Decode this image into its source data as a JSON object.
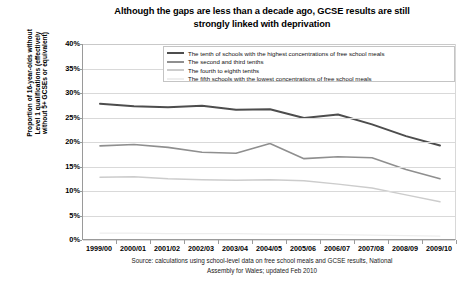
{
  "title": {
    "line1": "Although the gaps are less than a decade ago, GCSE results are still",
    "line2": "strongly linked with deprivation"
  },
  "yaxis_title": {
    "line1": "Proportion of 16-year-olds without",
    "line2": "Level 1 qualifications (effectively",
    "line3": "without 5+ GCSEs or equivalent)"
  },
  "source": {
    "line1": "Source: calculations using school-level data on free school meals and GCSE results, National",
    "line2": "Assembly for Wales; updated Feb 2010"
  },
  "colors": {
    "series1": "#4d4d4d",
    "series2": "#8f8f8f",
    "series3": "#cccccc",
    "series4": "#ededed",
    "grid": "#d9d9d9",
    "axis": "#9a9a9a",
    "background": "#ffffff"
  },
  "chart_data": {
    "type": "line",
    "title": "Although the gaps are less than a decade ago, GCSE results are still strongly linked with deprivation",
    "xlabel": "",
    "ylabel": "Proportion of 16-year-olds without Level 1 qualifications (effectively without 5+ GCSEs or equivalent)",
    "ylim": [
      0,
      40
    ],
    "yticks": [
      "0%",
      "5%",
      "10%",
      "15%",
      "20%",
      "25%",
      "30%",
      "35%",
      "40%"
    ],
    "ytick_values": [
      0,
      5,
      10,
      15,
      20,
      25,
      30,
      35,
      40
    ],
    "grid": true,
    "legend_position": "top-center",
    "categories": [
      "1999/00",
      "2000/01",
      "2001/02",
      "2002/03",
      "2003/04",
      "2004/05",
      "2005/06",
      "2006/07",
      "2007/08",
      "2008/09",
      "2009/10"
    ],
    "series": [
      {
        "name": "The tenth of schools with the highest concentrations of free school meals",
        "color": "#4d4d4d",
        "values": [
          27.8,
          27.3,
          27.1,
          27.4,
          26.6,
          26.7,
          24.9,
          25.6,
          23.6,
          21.2,
          19.3
        ]
      },
      {
        "name": "The second and third tenths",
        "color": "#8f8f8f",
        "values": [
          19.2,
          19.5,
          18.9,
          17.9,
          17.7,
          19.7,
          16.6,
          17.0,
          16.8,
          14.4,
          12.5
        ]
      },
      {
        "name": "The fourth to eighth tenths",
        "color": "#cccccc",
        "values": [
          12.8,
          12.9,
          12.5,
          12.3,
          12.2,
          12.3,
          12.1,
          11.4,
          10.6,
          9.2,
          7.8
        ]
      },
      {
        "name": "The fifth schools with the lowest concentrations of free school meals",
        "color": "#ededed",
        "values": [
          1.4,
          1.4,
          1.3,
          1.3,
          1.3,
          1.2,
          1.2,
          1.1,
          1.0,
          0.9,
          0.8
        ]
      }
    ]
  }
}
